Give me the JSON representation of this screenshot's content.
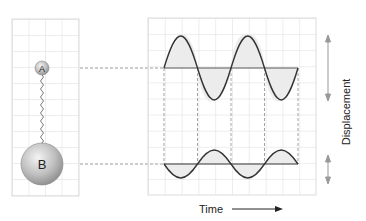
{
  "diagram": {
    "left_panel": {
      "ball_a_label": "A",
      "ball_b_label": "B"
    },
    "right_panel": {
      "x_axis_label": "Time",
      "y_axis_label": "Displacement"
    },
    "colors": {
      "grid": "#dcdcdc",
      "curve": "#333333",
      "dashed": "#999999",
      "arrow": "#999999"
    }
  }
}
